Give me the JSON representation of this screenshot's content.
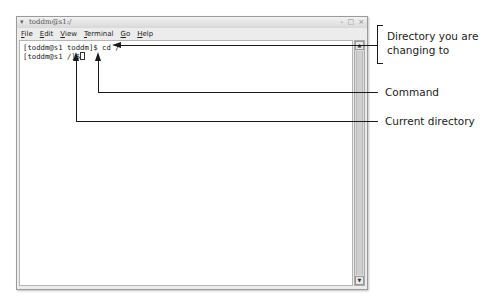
{
  "window": {
    "title": "toddm@s1:/",
    "title_icon": "terminal-menu-icon",
    "controls": {
      "minimize": "–",
      "maximize": "□",
      "close": "×"
    }
  },
  "menubar": {
    "items": [
      {
        "label": "File",
        "mnemonic": "F"
      },
      {
        "label": "Edit",
        "mnemonic": "E"
      },
      {
        "label": "View",
        "mnemonic": "V"
      },
      {
        "label": "Terminal",
        "mnemonic": "T"
      },
      {
        "label": "Go",
        "mnemonic": "G"
      },
      {
        "label": "Help",
        "mnemonic": "H"
      }
    ]
  },
  "terminal": {
    "lines": [
      "[toddm@s1 toddm]$ cd /",
      "[toddm@s1 /]$"
    ]
  },
  "scrollbar": {
    "up_arrow": "▲",
    "down_arrow": "▼"
  },
  "callouts": [
    {
      "text_line1": "Directory you are",
      "text_line2": "changing to"
    },
    {
      "text": "Command"
    },
    {
      "text": "Current directory"
    }
  ]
}
